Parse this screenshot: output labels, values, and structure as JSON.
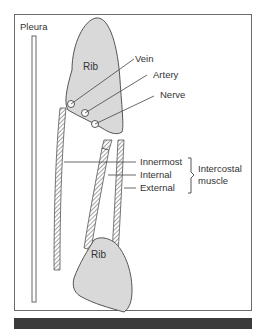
{
  "diagram": {
    "labels": {
      "pleura": "Pleura",
      "rib_upper": "Rib",
      "rib_lower": "Rib",
      "vein": "Vein",
      "artery": "Artery",
      "nerve": "Nerve",
      "innermost": "Innermost",
      "internal": "Internal",
      "external": "External",
      "group_line1": "Intercostal",
      "group_line2": "muscle"
    },
    "colors": {
      "bone_fill": "#d9d9d9",
      "stroke": "#555555",
      "border": "#6b6b6b",
      "bottom_bar": "#3a3a3a"
    }
  }
}
